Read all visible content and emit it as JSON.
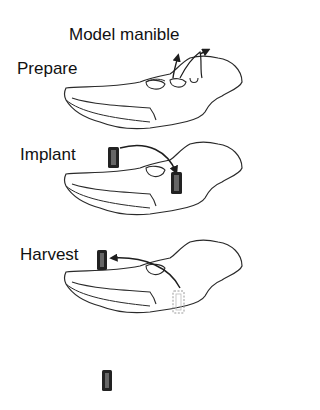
{
  "title": "Model manible",
  "steps": [
    {
      "id": "prepare",
      "label": "Prepare"
    },
    {
      "id": "implant",
      "label": "Implant"
    },
    {
      "id": "harvest",
      "label": "Harvest"
    }
  ],
  "colors": {
    "outline": "#2a2a2a",
    "implant": "#1e1e1e",
    "background": "#ffffff"
  }
}
